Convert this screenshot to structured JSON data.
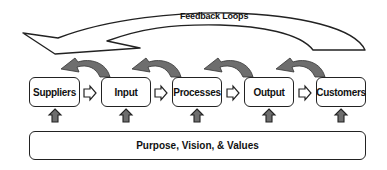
{
  "feedback": {
    "label": "Feedback Loops"
  },
  "stages": [
    {
      "label": "Suppliers",
      "x": 29
    },
    {
      "label": "Input",
      "x": 101
    },
    {
      "label": "Processes",
      "x": 172
    },
    {
      "label": "Output",
      "x": 244
    },
    {
      "label": "Customers",
      "x": 316
    }
  ],
  "foundation": {
    "label": "Purpose, Vision, & Values"
  },
  "colors": {
    "arrow_fill": "#6e6e6e",
    "outline": "#222222",
    "background": "#ffffff"
  }
}
